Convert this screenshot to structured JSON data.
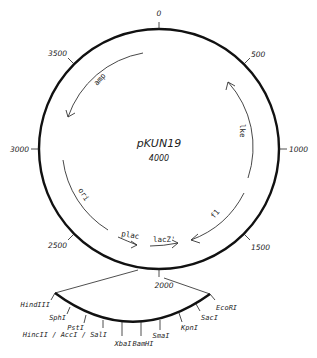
{
  "plasmid": {
    "name": "pKUN19",
    "size": "4000"
  },
  "ticks": [
    {
      "label": "0",
      "pos": 0
    },
    {
      "label": "500",
      "pos": 500
    },
    {
      "label": "1000",
      "pos": 1000
    },
    {
      "label": "1500",
      "pos": 1500
    },
    {
      "label": "2000",
      "pos": 2000
    },
    {
      "label": "2500",
      "pos": 2500
    },
    {
      "label": "3000",
      "pos": 3000
    },
    {
      "label": "3500",
      "pos": 3500
    }
  ],
  "features": [
    {
      "label": "amp",
      "direction": "counterclockwise"
    },
    {
      "label": "lke",
      "direction": "counterclockwise"
    },
    {
      "label": "f1",
      "direction": "clockwise"
    },
    {
      "label": "ori",
      "direction": "none"
    },
    {
      "label": "plac",
      "direction": "clockwise"
    },
    {
      "label": "lacZ'",
      "direction": "clockwise"
    }
  ],
  "mcs_sites": [
    {
      "label": "HindIII"
    },
    {
      "label": "SphI"
    },
    {
      "label": "PstI"
    },
    {
      "label": "HincII / AccI / SalI"
    },
    {
      "label": "XbaI"
    },
    {
      "label": "BamHI"
    },
    {
      "label": "SmaI"
    },
    {
      "label": "KpnI"
    },
    {
      "label": "SacI"
    },
    {
      "label": "EcoRI"
    }
  ],
  "colors": {
    "line": "#111111",
    "text": "#222222",
    "background": "#ffffff"
  }
}
